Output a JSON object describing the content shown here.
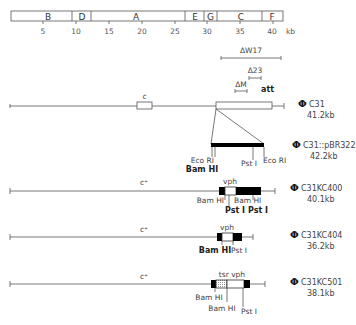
{
  "scale_map": {
    "segments": [
      {
        "label": "B",
        "x1": 11,
        "x2": 72
      },
      {
        "label": "D",
        "x1": 72,
        "x2": 91
      },
      {
        "label": "A",
        "x1": 91,
        "x2": 185
      },
      {
        "label": "E",
        "x1": 185,
        "x2": 204
      },
      {
        "label": "G",
        "x1": 204,
        "x2": 217
      },
      {
        "label": "C",
        "x1": 217,
        "x2": 262
      },
      {
        "label": "F",
        "x1": 262,
        "x2": 283
      }
    ],
    "ticks": [
      "5",
      "10",
      "15",
      "20",
      "25",
      "30",
      "35",
      "40"
    ],
    "unit": "kb"
  },
  "deletions": {
    "w17": "ΔW17",
    "d23": "Δ23",
    "dm": "ΔM",
    "att": "att"
  },
  "maps": [
    {
      "id": "c31",
      "phi": "Φ",
      "name": "C31",
      "size": "41.2kb",
      "gene_label": "c"
    },
    {
      "id": "c31pbr",
      "phi": "Φ",
      "name": "C31::pBR322",
      "size": "42.2kb",
      "sites": {
        "ecori_left": "Eco RI",
        "bamhi": "Bam HI",
        "psti": "Pst I",
        "ecori_right": "Eco RI"
      }
    },
    {
      "id": "kc400",
      "phi": "Φ",
      "name": "C31KC400",
      "size": "40.1kb",
      "gene_label": "c⁺",
      "insert_label": "vph",
      "sites": {
        "bamhi_1": "Bam HI",
        "bamhi_2": "Bam HI",
        "psti_1": "Pst I",
        "psti_2": "Pst I"
      }
    },
    {
      "id": "kc404",
      "phi": "Φ",
      "name": "C31KC404",
      "size": "36.2kb",
      "gene_label": "c⁺",
      "insert_label": "vph",
      "sites": {
        "bamhi": "Bam HI",
        "psti": "Pst I"
      }
    },
    {
      "id": "kc501",
      "phi": "Φ",
      "name": "C31KC501",
      "size": "38.1kb",
      "gene_label": "c⁺",
      "insert_label": "tsr vph",
      "sites": {
        "bamhi_1": "Bam HI",
        "bamhi_2": "Bam HI",
        "psti": "Pst I"
      }
    }
  ]
}
